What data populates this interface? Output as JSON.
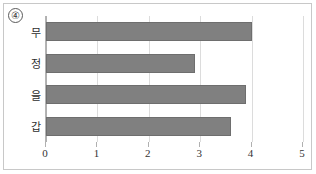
{
  "figure": {
    "marker_label": "④"
  },
  "chart_data": {
    "type": "bar",
    "orientation": "horizontal",
    "title": "",
    "xlabel": "",
    "ylabel": "",
    "categories": [
      "갑",
      "을",
      "정",
      "무"
    ],
    "values": [
      3.6,
      3.9,
      2.9,
      4.0
    ],
    "xlim": [
      0,
      5
    ],
    "xticks": [
      0,
      1,
      2,
      3,
      4,
      5
    ],
    "xtick_labels": [
      "0",
      "1",
      "2",
      "3",
      "4",
      "5"
    ],
    "grid": true,
    "grid_axis": "x",
    "legend": false,
    "legend_position": "none",
    "bar_color": "#808080",
    "bar_edge_color": "#6e6e6e",
    "gridline_color": "#dcdcdc",
    "axis_color": "#b0b0b0",
    "background_color": "#ffffff",
    "frame_color": "#c8c8c8"
  }
}
